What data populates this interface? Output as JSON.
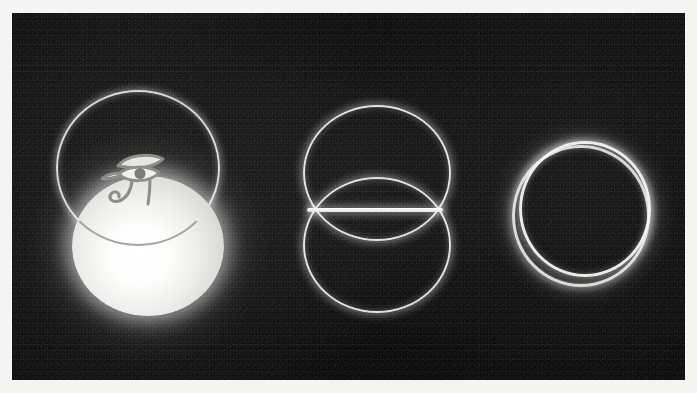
{
  "image": {
    "title": "Three glowing sacred-geometry figures on a dark grainy field",
    "alt_text": "Eye of Horus over intersecting circles, a vesica piscis with a horizontal chord, and two offset concentric rings",
    "background_color": "#0a0a0a",
    "border_color": "#f4f4f2",
    "glow_color": "#ffffff",
    "line_color": "#eeeeeb",
    "border_width_px": 12,
    "canvas_width_px": 697,
    "canvas_height_px": 393,
    "figure_count": 3
  },
  "figures": [
    {
      "id": "eye-of-horus-sphere",
      "name": "Eye of Horus over intersecting circles",
      "position": "left",
      "elements": [
        {
          "name": "upper outline circle",
          "style": "thin glowing stroke",
          "fill": "none"
        },
        {
          "name": "lower filled sphere",
          "style": "radial white gradient",
          "fill": "#ffffff"
        },
        {
          "name": "Eye of Horus glyph",
          "style": "outlined wedjat symbol",
          "fill": "#d9d9d6"
        }
      ],
      "center_x_px": 133,
      "center_y_px": 178
    },
    {
      "id": "vesica-piscis-chord",
      "name": "Vesica piscis with horizontal chord",
      "position": "center",
      "elements": [
        {
          "name": "upper circle",
          "style": "thin glowing stroke",
          "fill": "none"
        },
        {
          "name": "lower circle",
          "style": "thin glowing stroke",
          "fill": "none"
        },
        {
          "name": "horizontal chord line",
          "style": "bright bar",
          "fill": "#ffffff"
        }
      ],
      "center_x_px": 363,
      "center_y_px": 197
    },
    {
      "id": "offset-concentric-rings",
      "name": "Two offset concentric rings",
      "position": "right",
      "elements": [
        {
          "name": "outer ring",
          "style": "thick glowing stroke",
          "fill": "none"
        },
        {
          "name": "inner ring",
          "style": "thick glowing stroke",
          "fill": "none"
        }
      ],
      "center_x_px": 567,
      "center_y_px": 198
    }
  ]
}
